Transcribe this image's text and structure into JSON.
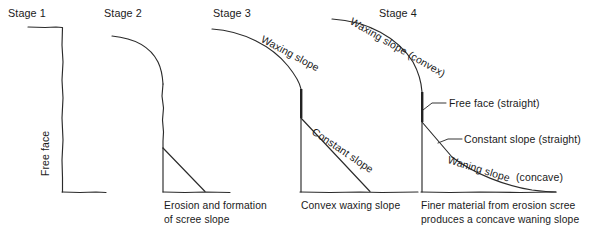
{
  "figure": {
    "title_implied": "Slope evolution stages",
    "line_color": "#2b2b2b",
    "background": "#ffffff"
  },
  "stages": [
    {
      "id": "stage-1",
      "label": "Stage 1",
      "annotations": [
        {
          "name": "free-face-label",
          "text": "Free face"
        }
      ],
      "caption": ""
    },
    {
      "id": "stage-2",
      "label": "Stage 2",
      "annotations": [],
      "caption": "Erosion and formation\nof scree slope"
    },
    {
      "id": "stage-3",
      "label": "Stage 3",
      "annotations": [
        {
          "name": "waxing-slope-label",
          "text": "Waxing slope"
        },
        {
          "name": "constant-slope-label",
          "text": "Constant slope"
        }
      ],
      "caption": "Convex waxing slope"
    },
    {
      "id": "stage-4",
      "label": "Stage 4",
      "annotations": [
        {
          "name": "waxing-slope-convex-label",
          "text": "Waxing slope (convex)"
        },
        {
          "name": "free-face-straight-label",
          "text": "Free face (straight)"
        },
        {
          "name": "constant-slope-straight-label",
          "text": "Constant slope (straight)"
        },
        {
          "name": "waning-slope-label",
          "text": "Waning slope"
        },
        {
          "name": "waning-slope-concave-label",
          "text": "(concave)"
        }
      ],
      "caption": "Finer material from erosion scree\nproduces a concave waning slope"
    }
  ]
}
